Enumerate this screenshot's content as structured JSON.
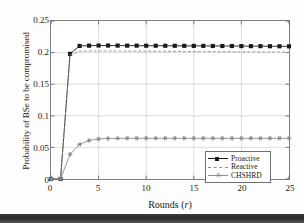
{
  "chart_data": {
    "type": "line",
    "title": "",
    "xlabel": "Rounds (r)",
    "xlabel_plain": "Rounds",
    "xlabel_symbol": "r",
    "ylabel": "Probability of BSe to be compromised",
    "xlim": [
      0,
      25
    ],
    "ylim": [
      0,
      0.25
    ],
    "grid": true,
    "legend_position": "lower right",
    "xticks": [
      "0",
      "5",
      "10",
      "15",
      "20",
      "25"
    ],
    "xtick_values": [
      0,
      5,
      10,
      15,
      20,
      25
    ],
    "yticks": [
      "0",
      "0.05",
      "0.1",
      "0.15",
      "0.2",
      "0.25"
    ],
    "ytick_values": [
      0,
      0.05,
      0.1,
      0.15,
      0.2,
      0.25
    ],
    "x": [
      0,
      1,
      2,
      3,
      4,
      5,
      6,
      7,
      8,
      9,
      10,
      11,
      12,
      13,
      14,
      15,
      16,
      17,
      18,
      19,
      20,
      21,
      22,
      23,
      24,
      25
    ],
    "series": [
      {
        "name": "Proactive",
        "color": "#1a1a1a",
        "linestyle": "solid",
        "marker": "square",
        "values": [
          0,
          0,
          0.198,
          0.2105,
          0.211,
          0.2112,
          0.2112,
          0.2111,
          0.211,
          0.211,
          0.2109,
          0.2109,
          0.2108,
          0.2108,
          0.2107,
          0.2106,
          0.2106,
          0.2105,
          0.2104,
          0.2104,
          0.2103,
          0.2102,
          0.2102,
          0.2101,
          0.21,
          0.2099
        ]
      },
      {
        "name": "Reactive",
        "color": "#8c8c8c",
        "linestyle": "dashed",
        "marker": "none",
        "values": [
          0,
          0,
          0.196,
          0.202,
          0.2025,
          0.2026,
          0.2026,
          0.2025,
          0.2024,
          0.2023,
          0.2022,
          0.2021,
          0.202,
          0.2019,
          0.2018,
          0.2017,
          0.2016,
          0.2015,
          0.2014,
          0.2013,
          0.2012,
          0.2011,
          0.201,
          0.2009,
          0.2008,
          0.2007
        ]
      },
      {
        "name": "CHSHRD",
        "color": "#8c8c8c",
        "linestyle": "solid",
        "marker": "asterisk",
        "values": [
          0,
          0,
          0.039,
          0.0548,
          0.061,
          0.0634,
          0.0641,
          0.0643,
          0.0644,
          0.0644,
          0.0644,
          0.0644,
          0.0644,
          0.0644,
          0.0644,
          0.0644,
          0.0644,
          0.0644,
          0.0644,
          0.0644,
          0.0644,
          0.0644,
          0.0644,
          0.0644,
          0.0644,
          0.0644
        ]
      }
    ]
  },
  "legend": {
    "items": [
      {
        "label": "Proactive"
      },
      {
        "label": "Reactive"
      },
      {
        "label": "CHSHRD"
      }
    ]
  }
}
